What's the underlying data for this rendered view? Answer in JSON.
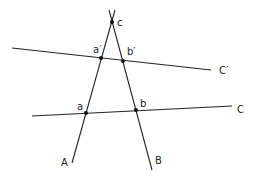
{
  "diagram": {
    "lines": [
      {
        "id": "A",
        "label": "A",
        "x1": 115,
        "y1": 10,
        "x2": 72,
        "y2": 163,
        "label_x": 61,
        "label_y": 166
      },
      {
        "id": "B",
        "label": "B",
        "x1": 109,
        "y1": 10,
        "x2": 152,
        "y2": 170,
        "label_x": 155,
        "label_y": 164
      },
      {
        "id": "C",
        "label": "C",
        "x1": 32,
        "y1": 116,
        "x2": 232,
        "y2": 106,
        "label_x": 237,
        "label_y": 113
      },
      {
        "id": "Cp",
        "label": "C′",
        "x1": 12,
        "y1": 48,
        "x2": 211,
        "y2": 70,
        "label_x": 219,
        "label_y": 74
      }
    ],
    "points": [
      {
        "id": "c",
        "label": "c",
        "x": 112,
        "y": 22,
        "label_x": 117,
        "label_y": 26
      },
      {
        "id": "ap",
        "label": "a′",
        "x": 101,
        "y": 58,
        "label_x": 93,
        "label_y": 53
      },
      {
        "id": "bp",
        "label": "b′",
        "x": 123,
        "y": 61,
        "label_x": 127,
        "label_y": 55
      },
      {
        "id": "a",
        "label": "a",
        "x": 86,
        "y": 113,
        "label_x": 77,
        "label_y": 110
      },
      {
        "id": "b",
        "label": "b",
        "x": 136,
        "y": 110,
        "label_x": 140,
        "label_y": 107
      }
    ]
  }
}
